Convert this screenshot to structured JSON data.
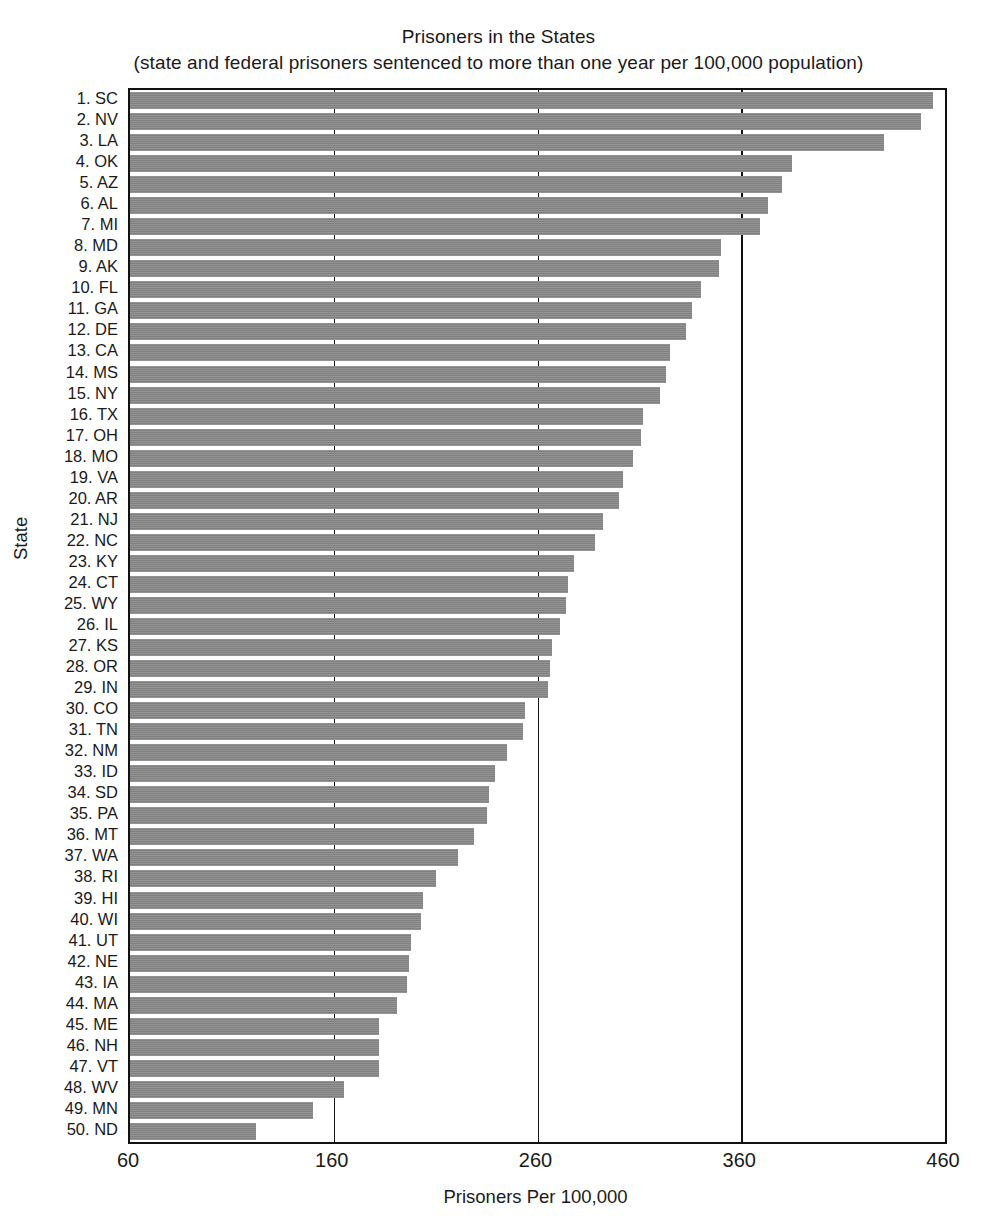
{
  "chart_data": {
    "type": "bar",
    "orientation": "horizontal",
    "title": "Prisoners in the States",
    "subtitle": "(state and federal prisoners sentenced to more than one year per 100,000 population)",
    "xlabel": "Prisoners Per 100,000",
    "ylabel": "State",
    "xlim": [
      60,
      460
    ],
    "xticks": [
      60,
      160,
      260,
      360,
      460
    ],
    "xtick_labels": [
      "60",
      "160",
      "260",
      "360",
      "460"
    ],
    "grid": "vertical",
    "legend": null,
    "bar_color": "#808080",
    "axis_color": "#111111",
    "categories": [
      "1. SC",
      "2. NV",
      "3. LA",
      "4. OK",
      "5. AZ",
      "6. AL",
      "7. MI",
      "8. MD",
      "9. AK",
      "10. FL",
      "11. GA",
      "12. DE",
      "13. CA",
      "14. MS",
      "15. NY",
      "16. TX",
      "17. OH",
      "18. MO",
      "19. VA",
      "20. AR",
      "21. NJ",
      "22. NC",
      "23. KY",
      "24. CT",
      "25. WY",
      "26. IL",
      "27. KS",
      "28. OR",
      "29. IN",
      "30. CO",
      "31. TN",
      "32. NM",
      "33. ID",
      "34. SD",
      "35. PA",
      "36. MT",
      "37. WA",
      "38. RI",
      "39. HI",
      "40. WI",
      "41. UT",
      "42. NE",
      "43. IA",
      "44. MA",
      "45. ME",
      "46. NH",
      "47. VT",
      "48. WV",
      "49. MN",
      "50. ND"
    ],
    "state_codes": [
      "SC",
      "NV",
      "LA",
      "OK",
      "AZ",
      "AL",
      "MI",
      "MD",
      "AK",
      "FL",
      "GA",
      "DE",
      "CA",
      "MS",
      "NY",
      "TX",
      "OH",
      "MO",
      "VA",
      "AR",
      "NJ",
      "NC",
      "KY",
      "CT",
      "WY",
      "IL",
      "KS",
      "OR",
      "IN",
      "CO",
      "TN",
      "NM",
      "ID",
      "SD",
      "PA",
      "MT",
      "WA",
      "RI",
      "HI",
      "WI",
      "UT",
      "NE",
      "IA",
      "MA",
      "ME",
      "NH",
      "VT",
      "WV",
      "MN",
      "ND"
    ],
    "values": [
      454,
      448,
      430,
      385,
      380,
      373,
      369,
      350,
      349,
      340,
      336,
      333,
      325,
      323,
      320,
      312,
      311,
      307,
      302,
      300,
      292,
      288,
      278,
      275,
      274,
      271,
      267,
      266,
      265,
      254,
      253,
      245,
      239,
      236,
      235,
      229,
      221,
      210,
      204,
      203,
      198,
      197,
      196,
      191,
      182,
      182,
      182,
      165,
      150,
      122
    ],
    "value_label_suffix": " per 100,000"
  }
}
